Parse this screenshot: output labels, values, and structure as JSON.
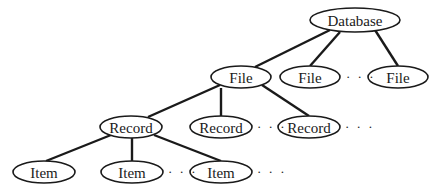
{
  "diagram": {
    "type": "tree",
    "nodes": [
      {
        "id": "db",
        "label": "Database",
        "level": 0,
        "cx": 355,
        "cy": 20,
        "rx": 45,
        "ry": 12
      },
      {
        "id": "file1",
        "label": "File",
        "level": 1,
        "cx": 241,
        "cy": 77,
        "rx": 30,
        "ry": 11
      },
      {
        "id": "file2",
        "label": "File",
        "level": 1,
        "cx": 310,
        "cy": 77,
        "rx": 30,
        "ry": 11
      },
      {
        "id": "file3",
        "label": "File",
        "level": 1,
        "cx": 398,
        "cy": 77,
        "rx": 30,
        "ry": 11
      },
      {
        "id": "rec1",
        "label": "Record",
        "level": 2,
        "cx": 131,
        "cy": 127,
        "rx": 31,
        "ry": 11
      },
      {
        "id": "rec2",
        "label": "Record",
        "level": 2,
        "cx": 221,
        "cy": 127,
        "rx": 31,
        "ry": 11
      },
      {
        "id": "rec3",
        "label": "Record",
        "level": 2,
        "cx": 309,
        "cy": 127,
        "rx": 31,
        "ry": 11
      },
      {
        "id": "item1",
        "label": "Item",
        "level": 3,
        "cx": 44,
        "cy": 172,
        "rx": 31,
        "ry": 11
      },
      {
        "id": "item2",
        "label": "Item",
        "level": 3,
        "cx": 132,
        "cy": 172,
        "rx": 31,
        "ry": 11
      },
      {
        "id": "item3",
        "label": "Item",
        "level": 3,
        "cx": 221,
        "cy": 172,
        "rx": 31,
        "ry": 11
      }
    ],
    "edges": [
      {
        "from": "db",
        "to": "file1",
        "x1": 330,
        "y1": 30,
        "x2": 255,
        "y2": 67
      },
      {
        "from": "db",
        "to": "file2",
        "x1": 340,
        "y1": 32,
        "x2": 310,
        "y2": 66
      },
      {
        "from": "db",
        "to": "file3",
        "x1": 375,
        "y1": 30,
        "x2": 398,
        "y2": 66
      },
      {
        "from": "file1",
        "to": "rec1",
        "x1": 220,
        "y1": 85,
        "x2": 148,
        "y2": 117
      },
      {
        "from": "file1",
        "to": "rec2",
        "x1": 221,
        "y1": 88,
        "x2": 221,
        "y2": 116
      },
      {
        "from": "file1",
        "to": "rec3",
        "x1": 262,
        "y1": 85,
        "x2": 309,
        "y2": 116
      },
      {
        "from": "rec1",
        "to": "item1",
        "x1": 111,
        "y1": 135,
        "x2": 46,
        "y2": 161
      },
      {
        "from": "rec1",
        "to": "item2",
        "x1": 132,
        "y1": 138,
        "x2": 132,
        "y2": 161
      },
      {
        "from": "rec1",
        "to": "item3",
        "x1": 154,
        "y1": 135,
        "x2": 221,
        "y2": 161
      }
    ],
    "ellipses": [
      {
        "after": "file2",
        "text": "· · ·",
        "x": 346,
        "y": 81
      },
      {
        "after": "rec2",
        "text": "· · ·",
        "x": 257,
        "y": 131
      },
      {
        "after": "rec3",
        "text": "· · ·",
        "x": 345,
        "y": 131
      },
      {
        "after": "item2",
        "text": "· · ·",
        "x": 168,
        "y": 176
      },
      {
        "after": "item3",
        "text": "· · ·",
        "x": 257,
        "y": 176
      }
    ]
  }
}
